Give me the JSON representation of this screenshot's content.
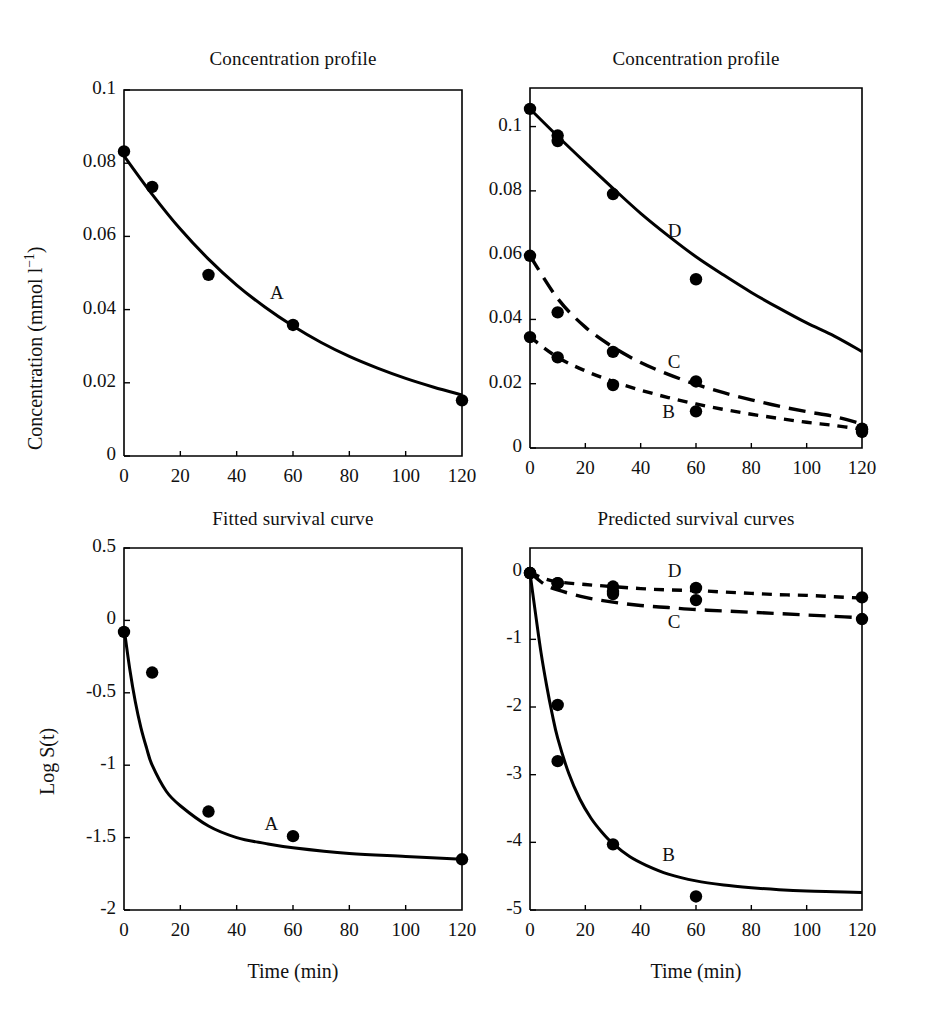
{
  "figure": {
    "background": "#ffffff",
    "ink": "#000000"
  },
  "panels": [
    {
      "id": "top-left",
      "title": "Concentration profile",
      "xlabel": "",
      "ylabel": "Concentration (mmol l−1)",
      "ylabel_base": "Concentration (mmol l",
      "ylabel_exp": "−1",
      "ylabel_tail": ")",
      "xticks": [
        "0",
        "20",
        "40",
        "60",
        "80",
        "100",
        "120"
      ],
      "yticks": [
        "0",
        "0.02",
        "0.04",
        "0.06",
        "0.08",
        "0.1"
      ],
      "curve_labels": [
        "A"
      ]
    },
    {
      "id": "top-right",
      "title": "Concentration profile",
      "xlabel": "",
      "ylabel": "",
      "xticks": [
        "0",
        "20",
        "40",
        "60",
        "80",
        "100",
        "120"
      ],
      "yticks": [
        "0",
        "0.02",
        "0.04",
        "0.06",
        "0.08",
        "0.1"
      ],
      "curve_labels": [
        "B",
        "C",
        "D"
      ]
    },
    {
      "id": "bottom-left",
      "title": "Fitted survival curve",
      "xlabel": "Time (min)",
      "ylabel": "Log S(t)",
      "xticks": [
        "0",
        "20",
        "40",
        "60",
        "80",
        "100",
        "120"
      ],
      "yticks": [
        "-2",
        "-1.5",
        "-1",
        "-0.5",
        "0",
        "0.5"
      ],
      "curve_labels": [
        "A"
      ]
    },
    {
      "id": "bottom-right",
      "title": "Predicted survival curves",
      "xlabel": "Time (min)",
      "ylabel": "",
      "xticks": [
        "0",
        "20",
        "40",
        "60",
        "80",
        "100",
        "120"
      ],
      "yticks": [
        "-5",
        "-4",
        "-3",
        "-2",
        "-1",
        "0"
      ],
      "curve_labels": [
        "B",
        "C",
        "D"
      ]
    }
  ],
  "chart_data": [
    {
      "type": "scatter",
      "panel": "top-left",
      "title": "Concentration profile",
      "xlabel": "",
      "ylabel": "Concentration (mmol l^-1)",
      "xlim": [
        0,
        120
      ],
      "ylim": [
        0,
        0.1
      ],
      "grid": false,
      "legend": "inline-annotation",
      "xticks": [
        0,
        20,
        40,
        60,
        80,
        100,
        120
      ],
      "yticks": [
        0,
        0.02,
        0.04,
        0.06,
        0.08,
        0.1
      ],
      "series": [
        {
          "name": "A",
          "style": "solid",
          "points_x": [
            0,
            10,
            30,
            60,
            120
          ],
          "points_y": [
            0.0832,
            0.0735,
            0.0495,
            0.0358,
            0.0152
          ],
          "fit_x": [
            0,
            10,
            20,
            30,
            40,
            50,
            60,
            70,
            80,
            90,
            100,
            110,
            120
          ],
          "fit_y": [
            0.082,
            0.0715,
            0.062,
            0.0538,
            0.0467,
            0.0407,
            0.0355,
            0.031,
            0.0272,
            0.024,
            0.0212,
            0.0188,
            0.0167
          ],
          "label_x": 54,
          "label_y": 0.044
        }
      ]
    },
    {
      "type": "scatter",
      "panel": "top-right",
      "title": "Concentration profile",
      "xlabel": "",
      "ylabel": "",
      "xlim": [
        0,
        120
      ],
      "ylim": [
        0,
        0.112
      ],
      "grid": false,
      "legend": "inline-annotation",
      "xticks": [
        0,
        20,
        40,
        60,
        80,
        100,
        120
      ],
      "yticks": [
        0,
        0.02,
        0.04,
        0.06,
        0.08,
        0.1
      ],
      "series": [
        {
          "name": "D",
          "style": "solid",
          "points_x": [
            0,
            10,
            10,
            30,
            60,
            120
          ],
          "points_y": [
            0.1055,
            0.0955,
            0.0972,
            0.079,
            0.0525,
            0.006
          ],
          "fit_x": [
            0,
            10,
            20,
            30,
            40,
            50,
            60,
            70,
            80,
            90,
            100,
            110,
            120
          ],
          "fit_y": [
            0.1055,
            0.097,
            0.0888,
            0.0808,
            0.073,
            0.066,
            0.0595,
            0.0538,
            0.0484,
            0.0435,
            0.0389,
            0.0348,
            0.03
          ],
          "label_x": 52,
          "label_y": 0.067
        },
        {
          "name": "C",
          "style": "long-dash",
          "points_x": [
            0,
            10,
            30,
            60,
            120
          ],
          "points_y": [
            0.0598,
            0.0422,
            0.0299,
            0.0207,
            0.0058
          ],
          "fit_x": [
            0,
            10,
            20,
            30,
            40,
            50,
            60,
            70,
            80,
            90,
            100,
            110,
            120
          ],
          "fit_y": [
            0.0598,
            0.0465,
            0.0376,
            0.0314,
            0.0266,
            0.0229,
            0.0198,
            0.0172,
            0.015,
            0.013,
            0.0113,
            0.0098,
            0.0075
          ],
          "label_x": 52,
          "label_y": 0.0262
        },
        {
          "name": "B",
          "style": "short-dash",
          "points_x": [
            0,
            10,
            30,
            60,
            120
          ],
          "points_y": [
            0.0345,
            0.0282,
            0.0196,
            0.0114,
            0.005
          ],
          "fit_x": [
            0,
            10,
            20,
            30,
            40,
            50,
            60,
            70,
            80,
            90,
            100,
            110,
            120
          ],
          "fit_y": [
            0.0345,
            0.0282,
            0.024,
            0.0207,
            0.018,
            0.0157,
            0.0137,
            0.012,
            0.0105,
            0.0092,
            0.008,
            0.007,
            0.0058
          ],
          "label_x": 50,
          "label_y": 0.0107
        }
      ]
    },
    {
      "type": "scatter",
      "panel": "bottom-left",
      "title": "Fitted survival curve",
      "xlabel": "Time (min)",
      "ylabel": "Log S(t)",
      "xlim": [
        0,
        120
      ],
      "ylim": [
        -2,
        0.5
      ],
      "grid": false,
      "legend": "inline-annotation",
      "xticks": [
        0,
        20,
        40,
        60,
        80,
        100,
        120
      ],
      "yticks": [
        -2,
        -1.5,
        -1,
        -0.5,
        0,
        0.5
      ],
      "series": [
        {
          "name": "A",
          "style": "solid",
          "points_x": [
            0,
            10,
            30,
            60,
            120
          ],
          "points_y": [
            -0.08,
            -0.36,
            -1.32,
            -1.49,
            -1.65
          ],
          "fit_x": [
            0,
            2,
            4,
            6,
            8,
            10,
            15,
            20,
            30,
            40,
            50,
            60,
            80,
            100,
            120
          ],
          "fit_y": [
            -0.05,
            -0.33,
            -0.56,
            -0.74,
            -0.88,
            -1.0,
            -1.18,
            -1.28,
            -1.42,
            -1.5,
            -1.54,
            -1.57,
            -1.61,
            -1.63,
            -1.65
          ],
          "label_x": 52,
          "label_y": -1.42
        }
      ]
    },
    {
      "type": "scatter",
      "panel": "bottom-right",
      "title": "Predicted survival curves",
      "xlabel": "Time (min)",
      "ylabel": "",
      "xlim": [
        0,
        120
      ],
      "ylim": [
        -5,
        0.35
      ],
      "grid": false,
      "legend": "inline-annotation",
      "xticks": [
        0,
        20,
        40,
        60,
        80,
        100,
        120
      ],
      "yticks": [
        -5,
        -4,
        -3,
        -2,
        -1,
        0
      ],
      "series": [
        {
          "name": "D",
          "style": "short-dash",
          "points_x": [
            0,
            10,
            30,
            30,
            60,
            120
          ],
          "points_y": [
            -0.02,
            -0.17,
            -0.22,
            -0.33,
            -0.24,
            -0.38
          ],
          "fit_x": [
            0,
            5,
            10,
            20,
            30,
            40,
            50,
            60,
            70,
            80,
            90,
            100,
            110,
            120
          ],
          "fit_y": [
            -0.01,
            -0.1,
            -0.15,
            -0.19,
            -0.22,
            -0.25,
            -0.27,
            -0.28,
            -0.3,
            -0.32,
            -0.34,
            -0.35,
            -0.37,
            -0.39
          ],
          "label_x": 52,
          "label_y": -0.02
        },
        {
          "name": "C",
          "style": "long-dash",
          "points_x": [
            0,
            10,
            30,
            60,
            120
          ],
          "points_y": [
            -0.02,
            -0.17,
            -0.3,
            -0.42,
            -0.7
          ],
          "fit_x": [
            0,
            5,
            10,
            20,
            30,
            40,
            50,
            60,
            70,
            80,
            90,
            100,
            110,
            120
          ],
          "fit_y": [
            -0.01,
            -0.18,
            -0.27,
            -0.38,
            -0.45,
            -0.5,
            -0.53,
            -0.56,
            -0.58,
            -0.6,
            -0.62,
            -0.64,
            -0.66,
            -0.68
          ],
          "label_x": 52,
          "label_y": -0.78
        },
        {
          "name": "B",
          "style": "solid",
          "points_x": [
            0,
            10,
            10,
            30,
            60
          ],
          "points_y": [
            -0.02,
            -1.97,
            -2.8,
            -4.03,
            -4.8
          ],
          "fit_x": [
            0,
            2,
            4,
            6,
            8,
            10,
            14,
            18,
            22,
            26,
            30,
            36,
            42,
            50,
            60,
            70,
            80,
            90,
            100,
            110,
            120
          ],
          "fit_y": [
            -0.02,
            -0.62,
            -1.2,
            -1.68,
            -2.1,
            -2.46,
            -2.98,
            -3.36,
            -3.64,
            -3.85,
            -4.02,
            -4.21,
            -4.34,
            -4.47,
            -4.57,
            -4.63,
            -4.67,
            -4.7,
            -4.72,
            -4.73,
            -4.74
          ],
          "label_x": 50,
          "label_y": -4.22
        }
      ]
    }
  ]
}
